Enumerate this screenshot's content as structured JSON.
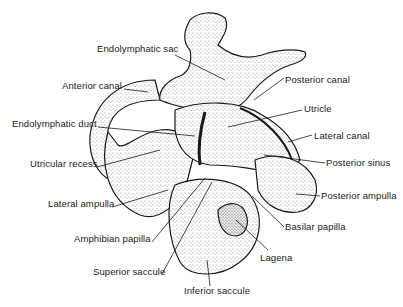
{
  "figure": {
    "colors": {
      "ink": "#1a1a1a",
      "stipple": "#333333",
      "background": "#ffffff"
    },
    "labels": [
      {
        "id": "endolymphatic-sac",
        "text": "Endolymphatic sac",
        "x": 97,
        "y": 48
      },
      {
        "id": "anterior-canal",
        "text": "Anterior canal",
        "x": 62,
        "y": 84
      },
      {
        "id": "endolymphatic-duct",
        "text": "Endolymphatic duct",
        "x": 12,
        "y": 122
      },
      {
        "id": "utricular-recess",
        "text": "Utricular recess",
        "x": 30,
        "y": 162
      },
      {
        "id": "lateral-ampulla",
        "text": "Lateral ampulla",
        "x": 48,
        "y": 202
      },
      {
        "id": "amphibian-papilla",
        "text": "Amphibian papilla",
        "x": 74,
        "y": 237
      },
      {
        "id": "superior-saccule",
        "text": "Superior saccule",
        "x": 93,
        "y": 270
      },
      {
        "id": "inferior-saccule",
        "text": "Inferior saccule",
        "x": 184,
        "y": 289
      },
      {
        "id": "posterior-canal",
        "text": "Posterior canal",
        "x": 285,
        "y": 75
      },
      {
        "id": "utricle",
        "text": "Utricle",
        "x": 304,
        "y": 104
      },
      {
        "id": "lateral-canal",
        "text": "Lateral canal",
        "x": 314,
        "y": 131
      },
      {
        "id": "posterior-sinus",
        "text": "Posterior sinus",
        "x": 326,
        "y": 158
      },
      {
        "id": "posterior-ampulla",
        "text": "Posterior ampulla",
        "x": 321,
        "y": 191
      },
      {
        "id": "basilar-papilla",
        "text": "Basilar papilla",
        "x": 285,
        "y": 222
      },
      {
        "id": "lagena",
        "text": "Lagena",
        "x": 260,
        "y": 253
      }
    ]
  }
}
